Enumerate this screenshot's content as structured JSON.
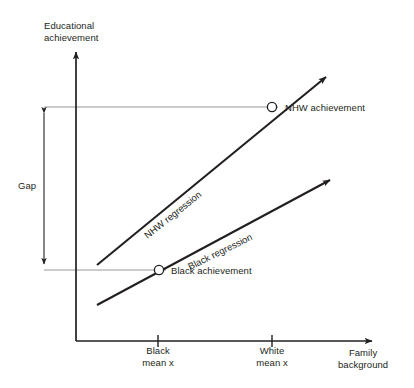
{
  "figure": {
    "type": "conceptual-diagram",
    "axes": {
      "y_title": "Educational\nachievement",
      "x_title": "Family\nbackground",
      "y_title_lines": [
        "Educational",
        "achievement"
      ],
      "x_title_lines": [
        "Family",
        "background"
      ]
    },
    "x_ticks": [
      {
        "id": "black-mean",
        "label": "Black\nmean x",
        "lines": [
          "Black",
          "mean x"
        ],
        "x": 158
      },
      {
        "id": "white-mean",
        "label": "White\nmean x",
        "lines": [
          "White",
          "mean x"
        ],
        "x": 272
      }
    ],
    "annotations": {
      "gap_label": "Gap"
    },
    "series": [
      {
        "id": "nhw-regression",
        "label": "NHW regression",
        "slope_label_rotation_deg": -38.5,
        "point": {
          "label": "NHW achievement",
          "x": 272,
          "y": 107
        }
      },
      {
        "id": "black-regression",
        "label": "Black regression",
        "slope_label_rotation_deg": -26,
        "point": {
          "label": "Black achievement",
          "x": 159,
          "y": 270
        }
      }
    ],
    "colors": {
      "ink": "#231f20",
      "axis": "#231f20",
      "guide": "#8d8d8d",
      "background": "#ffffff"
    }
  },
  "chart_data": {
    "type": "line",
    "title": "",
    "xlabel": "Family background",
    "ylabel": "Educational achievement",
    "grid": false,
    "legend": "inline-labels",
    "categories": [
      "Black mean x",
      "White mean x"
    ],
    "series": [
      {
        "name": "NHW regression",
        "values": [
          null,
          107
        ]
      },
      {
        "name": "Black regression",
        "values": [
          270,
          null
        ]
      }
    ],
    "annotations": [
      "Gap",
      "NHW achievement",
      "Black achievement"
    ]
  }
}
